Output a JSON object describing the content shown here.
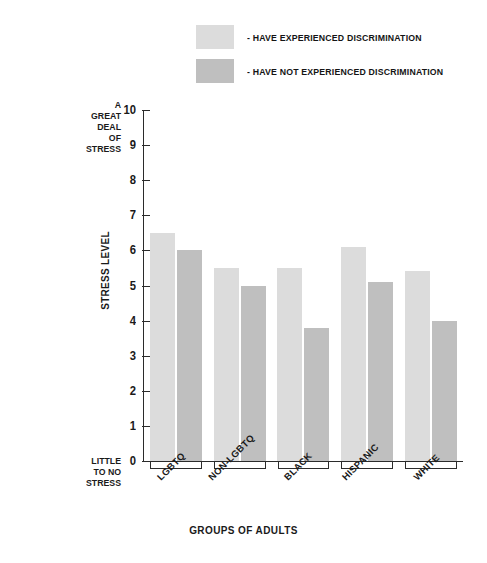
{
  "chart_data": {
    "type": "bar",
    "title": "",
    "subtitle": "",
    "xlabel": "GROUPS OF ADULTS",
    "ylabel": "STRESS LEVEL",
    "ylim": [
      0,
      10
    ],
    "ytick_values": [
      10,
      9,
      8,
      7,
      6,
      5,
      4,
      3,
      2,
      1,
      0
    ],
    "ytick_labels": [
      "10",
      "9",
      "8",
      "7",
      "6",
      "5",
      "4",
      "3",
      "2",
      "1",
      "0"
    ],
    "y_axis_top_annotation": "A GREAT DEAL\nOF STRESS",
    "y_axis_bottom_annotation": "LITTLE TO NO STRESS",
    "grid": false,
    "legend_position": "top",
    "categories": [
      "LGBTQ",
      "NON-LGBTQ",
      "BLACK",
      "HISPANIC",
      "WHITE"
    ],
    "series": [
      {
        "name": "- HAVE EXPERIENCED DISCRIMINATION",
        "color": "#dcdcdc",
        "values": [
          6.5,
          5.5,
          5.5,
          6.1,
          5.4
        ]
      },
      {
        "name": "- HAVE NOT EXPERIENCED DISCRIMINATION",
        "color": "#bfbfbf",
        "values": [
          6.0,
          5.0,
          3.8,
          5.1,
          4.0
        ]
      }
    ]
  }
}
